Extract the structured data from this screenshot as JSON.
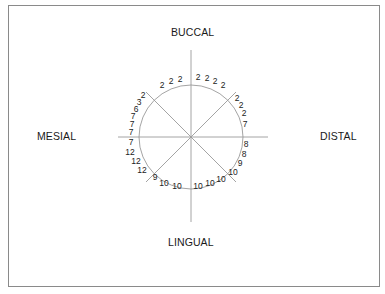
{
  "labels": {
    "top": "BUCCAL",
    "bottom": "LINGUAL",
    "left": "MESIAL",
    "right": "DISTAL"
  },
  "diagram": {
    "type": "circular periodontal/probing chart",
    "center": [
      191,
      137
    ],
    "radius": 52,
    "line_color": "#9a9a9a",
    "values_clockwise_from_top": {
      "buccal_right": [
        "2",
        "2",
        "2",
        "2"
      ],
      "distal_upper": [
        "2",
        "2",
        "2",
        "7"
      ],
      "distal_lower": [
        "8",
        "8",
        "9",
        "10"
      ],
      "lingual_right": [
        "10",
        "10",
        "10"
      ],
      "lingual_left": [
        "10",
        "10",
        "9"
      ],
      "mesial_lower": [
        "12",
        "12",
        "12",
        "7"
      ],
      "mesial_upper": [
        "7",
        "7",
        "7",
        "6",
        "3",
        "2"
      ],
      "buccal_left": [
        "2",
        "2",
        "2"
      ]
    },
    "points": [
      {
        "t": "2",
        "x": 180,
        "y": 82
      },
      {
        "t": "2",
        "x": 171,
        "y": 84
      },
      {
        "t": "2",
        "x": 162,
        "y": 88
      },
      {
        "t": "2",
        "x": 198,
        "y": 80
      },
      {
        "t": "2",
        "x": 207,
        "y": 81
      },
      {
        "t": "2",
        "x": 215,
        "y": 84
      },
      {
        "t": "2",
        "x": 223,
        "y": 88
      },
      {
        "t": "2",
        "x": 237,
        "y": 101
      },
      {
        "t": "2",
        "x": 241,
        "y": 108
      },
      {
        "t": "2",
        "x": 244,
        "y": 116
      },
      {
        "t": "7",
        "x": 245,
        "y": 127
      },
      {
        "t": "8",
        "x": 246,
        "y": 147
      },
      {
        "t": "8",
        "x": 244,
        "y": 157
      },
      {
        "t": "9",
        "x": 240,
        "y": 166
      },
      {
        "t": "10",
        "x": 233,
        "y": 175
      },
      {
        "t": "10",
        "x": 221,
        "y": 182
      },
      {
        "t": "10",
        "x": 210,
        "y": 186
      },
      {
        "t": "10",
        "x": 198,
        "y": 189
      },
      {
        "t": "10",
        "x": 177,
        "y": 189
      },
      {
        "t": "10",
        "x": 164,
        "y": 186
      },
      {
        "t": "9",
        "x": 155,
        "y": 180
      },
      {
        "t": "12",
        "x": 142,
        "y": 173
      },
      {
        "t": "12",
        "x": 136,
        "y": 164
      },
      {
        "t": "12",
        "x": 130,
        "y": 155
      },
      {
        "t": "7",
        "x": 131,
        "y": 145
      },
      {
        "t": "7",
        "x": 131,
        "y": 135
      },
      {
        "t": "7",
        "x": 132,
        "y": 127
      },
      {
        "t": "7",
        "x": 133,
        "y": 119
      },
      {
        "t": "6",
        "x": 136,
        "y": 112
      },
      {
        "t": "3",
        "x": 139,
        "y": 105
      },
      {
        "t": "2",
        "x": 143,
        "y": 98
      }
    ]
  }
}
